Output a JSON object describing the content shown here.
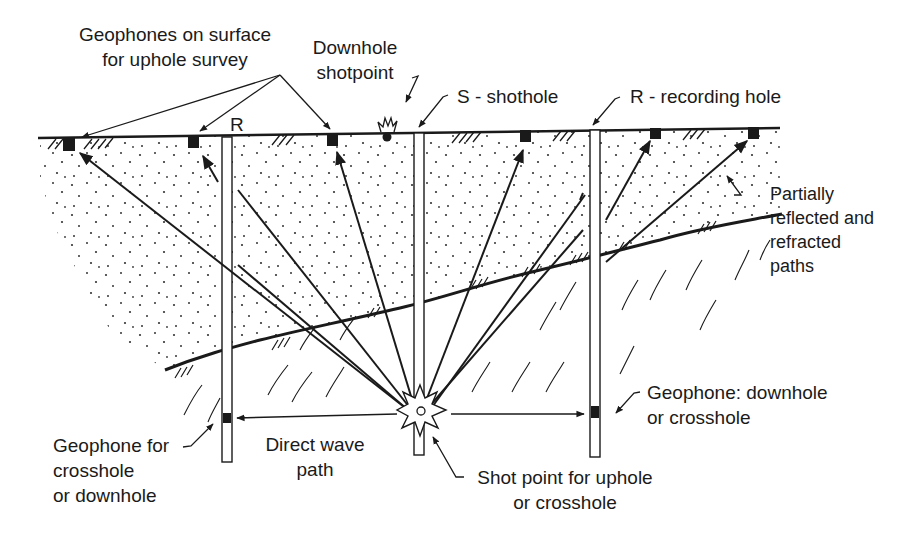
{
  "diagram": {
    "labels": {
      "surface_geophones_1": "Geophones on surface",
      "surface_geophones_2": "for uphole survey",
      "downhole_shotpoint_1": "Downhole",
      "downhole_shotpoint_2": "shotpoint",
      "shothole": "S - shothole",
      "recording_hole": "R - recording hole",
      "r_marker": "R",
      "partial_paths_1": "Partially",
      "partial_paths_2": "reflected and",
      "partial_paths_3": "refracted",
      "partial_paths_4": "paths",
      "geophone_crosshole_1": "Geophone for",
      "geophone_crosshole_2": "crosshole",
      "geophone_crosshole_3": "or downhole",
      "direct_wave_1": "Direct wave",
      "direct_wave_2": "path",
      "shot_point_1": "Shot point for uphole",
      "shot_point_2": "or crosshole",
      "geophone_downhole_1": "Geophone: downhole",
      "geophone_downhole_2": "or crosshole"
    },
    "colors": {
      "ink": "#1a1a1a",
      "background": "#ffffff"
    }
  }
}
